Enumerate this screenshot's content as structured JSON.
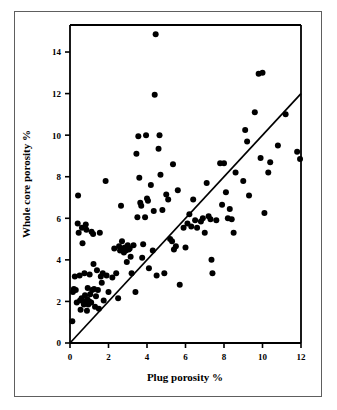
{
  "figure": {
    "caption_remnant": "",
    "frame_color": "#5e5e5e",
    "background": "#ffffff",
    "marker_color": "#000000",
    "axis_color": "#000000",
    "line_color": "#000000"
  },
  "chart_data": {
    "type": "scatter",
    "title": "",
    "xlabel": "Plug porosity %",
    "ylabel": "Whole core porosity %",
    "xlim": [
      0,
      12
    ],
    "ylim": [
      0,
      15.3
    ],
    "xticks": [
      0,
      2,
      4,
      6,
      8,
      10,
      12
    ],
    "xticklabels": [
      "0",
      "2",
      "4",
      "6",
      "8",
      "10",
      "12"
    ],
    "yticks": [
      0,
      2,
      4,
      6,
      8,
      10,
      12,
      14
    ],
    "yticklabels": [
      "0",
      "2",
      "4",
      "6",
      "8",
      "10",
      "12",
      "14"
    ],
    "grid": false,
    "legend": null,
    "marker": "filled-circle",
    "marker_size_px": 4.2,
    "reference_line": {
      "name": "one-to-one line",
      "type": "line",
      "slope": 1,
      "intercept": 0,
      "x": [
        0,
        12
      ],
      "y": [
        0,
        12
      ]
    },
    "series": [
      {
        "name": "core samples",
        "points": [
          [
            0.12,
            1.05
          ],
          [
            0.15,
            2.45
          ],
          [
            0.2,
            2.6
          ],
          [
            0.25,
            3.2
          ],
          [
            0.3,
            2.55
          ],
          [
            0.35,
            1.95
          ],
          [
            0.4,
            5.75
          ],
          [
            0.42,
            7.1
          ],
          [
            0.45,
            5.3
          ],
          [
            0.5,
            3.25
          ],
          [
            0.52,
            2.05
          ],
          [
            0.55,
            1.6
          ],
          [
            0.6,
            2.15
          ],
          [
            0.62,
            5.55
          ],
          [
            0.65,
            4.8
          ],
          [
            0.7,
            2.0
          ],
          [
            0.72,
            1.85
          ],
          [
            0.75,
            3.35
          ],
          [
            0.78,
            2.3
          ],
          [
            0.8,
            1.95
          ],
          [
            0.82,
            5.7
          ],
          [
            0.85,
            5.45
          ],
          [
            0.88,
            1.55
          ],
          [
            0.9,
            2.1
          ],
          [
            0.92,
            2.65
          ],
          [
            0.95,
            1.85
          ],
          [
            1.0,
            2.0
          ],
          [
            1.02,
            3.3
          ],
          [
            1.05,
            2.35
          ],
          [
            1.1,
            1.95
          ],
          [
            1.12,
            5.35
          ],
          [
            1.15,
            2.55
          ],
          [
            1.2,
            5.25
          ],
          [
            1.22,
            3.8
          ],
          [
            1.25,
            2.6
          ],
          [
            1.3,
            1.75
          ],
          [
            1.35,
            2.25
          ],
          [
            1.4,
            3.5
          ],
          [
            1.45,
            2.55
          ],
          [
            1.5,
            1.65
          ],
          [
            1.55,
            5.3
          ],
          [
            1.6,
            3.2
          ],
          [
            1.65,
            2.9
          ],
          [
            1.7,
            3.35
          ],
          [
            1.75,
            2.05
          ],
          [
            1.85,
            7.8
          ],
          [
            1.9,
            3.25
          ],
          [
            2.0,
            2.45
          ],
          [
            2.2,
            3.15
          ],
          [
            2.3,
            4.55
          ],
          [
            2.4,
            3.35
          ],
          [
            2.5,
            2.15
          ],
          [
            2.55,
            4.65
          ],
          [
            2.6,
            4.45
          ],
          [
            2.65,
            6.6
          ],
          [
            2.7,
            4.9
          ],
          [
            2.75,
            4.55
          ],
          [
            2.8,
            4.35
          ],
          [
            2.85,
            4.6
          ],
          [
            2.9,
            4.45
          ],
          [
            2.95,
            3.9
          ],
          [
            3.0,
            4.7
          ],
          [
            3.05,
            4.5
          ],
          [
            3.1,
            4.55
          ],
          [
            3.15,
            4.15
          ],
          [
            3.2,
            3.35
          ],
          [
            3.3,
            4.7
          ],
          [
            3.4,
            2.45
          ],
          [
            3.45,
            9.1
          ],
          [
            3.5,
            6.05
          ],
          [
            3.55,
            9.95
          ],
          [
            3.6,
            7.95
          ],
          [
            3.65,
            6.75
          ],
          [
            3.7,
            6.6
          ],
          [
            3.75,
            4.1
          ],
          [
            3.8,
            4.75
          ],
          [
            3.9,
            6.05
          ],
          [
            3.95,
            10.0
          ],
          [
            4.0,
            6.95
          ],
          [
            4.05,
            6.85
          ],
          [
            4.1,
            3.6
          ],
          [
            4.2,
            7.6
          ],
          [
            4.3,
            4.45
          ],
          [
            4.35,
            6.35
          ],
          [
            4.4,
            11.95
          ],
          [
            4.45,
            14.85
          ],
          [
            4.5,
            3.25
          ],
          [
            4.6,
            9.35
          ],
          [
            4.65,
            10.0
          ],
          [
            4.7,
            8.1
          ],
          [
            4.8,
            6.4
          ],
          [
            4.9,
            3.35
          ],
          [
            5.0,
            7.15
          ],
          [
            5.1,
            6.9
          ],
          [
            5.2,
            5.0
          ],
          [
            5.3,
            4.9
          ],
          [
            5.35,
            8.6
          ],
          [
            5.4,
            4.5
          ],
          [
            5.5,
            4.65
          ],
          [
            5.6,
            7.35
          ],
          [
            5.7,
            2.8
          ],
          [
            5.9,
            5.55
          ],
          [
            6.0,
            4.6
          ],
          [
            6.1,
            5.75
          ],
          [
            6.2,
            6.2
          ],
          [
            6.3,
            5.6
          ],
          [
            6.4,
            6.9
          ],
          [
            6.5,
            5.9
          ],
          [
            6.6,
            5.55
          ],
          [
            6.8,
            5.85
          ],
          [
            6.9,
            6.0
          ],
          [
            7.0,
            5.3
          ],
          [
            7.1,
            7.7
          ],
          [
            7.2,
            6.1
          ],
          [
            7.3,
            5.95
          ],
          [
            7.35,
            4.0
          ],
          [
            7.4,
            3.35
          ],
          [
            7.6,
            5.9
          ],
          [
            7.8,
            8.65
          ],
          [
            7.9,
            6.65
          ],
          [
            8.0,
            8.65
          ],
          [
            8.1,
            7.25
          ],
          [
            8.2,
            6.0
          ],
          [
            8.3,
            6.45
          ],
          [
            8.4,
            5.95
          ],
          [
            8.5,
            5.3
          ],
          [
            8.6,
            8.2
          ],
          [
            9.0,
            7.8
          ],
          [
            9.1,
            10.25
          ],
          [
            9.2,
            9.7
          ],
          [
            9.3,
            7.1
          ],
          [
            9.6,
            11.1
          ],
          [
            9.8,
            12.95
          ],
          [
            9.9,
            8.9
          ],
          [
            10.0,
            13.0
          ],
          [
            10.1,
            6.25
          ],
          [
            10.3,
            8.2
          ],
          [
            10.4,
            8.7
          ],
          [
            10.8,
            9.5
          ],
          [
            11.2,
            11.0
          ],
          [
            11.8,
            9.2
          ],
          [
            11.95,
            8.85
          ]
        ]
      }
    ]
  }
}
